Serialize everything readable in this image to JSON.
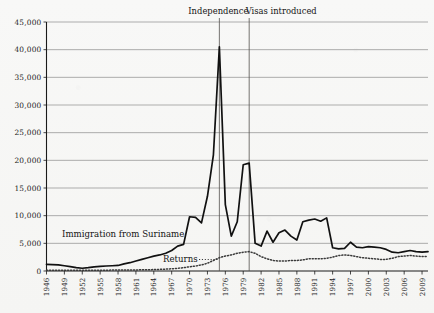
{
  "chart_data": {
    "type": "line",
    "title": "",
    "xlabel": "",
    "ylabel": "",
    "xlim": [
      1946,
      2010
    ],
    "ylim": [
      0,
      45000
    ],
    "grid": true,
    "legend_position": "inline-annotation",
    "x_tick_labels": [
      "1946",
      "1949",
      "1952",
      "1955",
      "1958",
      "1961",
      "1964",
      "1967",
      "1970",
      "1973",
      "1976",
      "1979",
      "1982",
      "1985",
      "1988",
      "1991",
      "1994",
      "1997",
      "2000",
      "2003",
      "2006",
      "2009"
    ],
    "y_tick_labels": [
      "0",
      "5,000",
      "10,000",
      "15,000",
      "20,000",
      "25,000",
      "30,000",
      "35,000",
      "40,000",
      "45,000"
    ],
    "y_tick_values": [
      0,
      5000,
      10000,
      15000,
      20000,
      25000,
      30000,
      35000,
      40000,
      45000
    ],
    "x": [
      1946,
      1947,
      1948,
      1949,
      1950,
      1951,
      1952,
      1953,
      1954,
      1955,
      1956,
      1957,
      1958,
      1959,
      1960,
      1961,
      1962,
      1963,
      1964,
      1965,
      1966,
      1967,
      1968,
      1969,
      1970,
      1971,
      1972,
      1973,
      1974,
      1975,
      1976,
      1977,
      1978,
      1979,
      1980,
      1981,
      1982,
      1983,
      1984,
      1985,
      1986,
      1987,
      1988,
      1989,
      1990,
      1991,
      1992,
      1993,
      1994,
      1995,
      1996,
      1997,
      1998,
      1999,
      2000,
      2001,
      2002,
      2003,
      2004,
      2005,
      2006,
      2007,
      2008,
      2009,
      2010
    ],
    "series": [
      {
        "name": "Immigration from Suriname",
        "style": "solid",
        "color": "#111111",
        "values": [
          1200,
          1150,
          1100,
          950,
          800,
          600,
          500,
          600,
          750,
          850,
          900,
          950,
          1000,
          1300,
          1500,
          1800,
          2100,
          2400,
          2700,
          2900,
          3200,
          3700,
          4500,
          4800,
          9800,
          9700,
          8700,
          13500,
          21000,
          40500,
          12000,
          6300,
          8900,
          19200,
          19500,
          5000,
          4500,
          7200,
          5200,
          6900,
          7400,
          6300,
          5600,
          8900,
          9200,
          9400,
          9000,
          9600,
          4200,
          4000,
          4100,
          5200,
          4300,
          4200,
          4400,
          4300,
          4200,
          3900,
          3400,
          3300,
          3500,
          3700,
          3500,
          3400,
          3500
        ]
      },
      {
        "name": "Returns",
        "style": "dotted",
        "color": "#3a3a3a",
        "values": [
          150,
          150,
          150,
          150,
          150,
          150,
          150,
          150,
          150,
          150,
          150,
          160,
          170,
          180,
          190,
          200,
          210,
          230,
          260,
          300,
          340,
          400,
          480,
          600,
          760,
          900,
          1100,
          1400,
          1900,
          2400,
          2700,
          2900,
          3200,
          3400,
          3500,
          3200,
          2600,
          2200,
          1900,
          1800,
          1800,
          1900,
          1900,
          2000,
          2200,
          2200,
          2200,
          2300,
          2500,
          2800,
          2900,
          2800,
          2600,
          2400,
          2300,
          2200,
          2100,
          2100,
          2300,
          2600,
          2700,
          2800,
          2700,
          2600,
          2600
        ]
      }
    ],
    "annotations": [
      {
        "label": "Independence",
        "x": 1975
      },
      {
        "label": "Visas introduced",
        "x": 1980
      }
    ],
    "series_inline_labels": [
      {
        "label": "Immigration from Suriname"
      },
      {
        "label": "Returns"
      }
    ]
  }
}
